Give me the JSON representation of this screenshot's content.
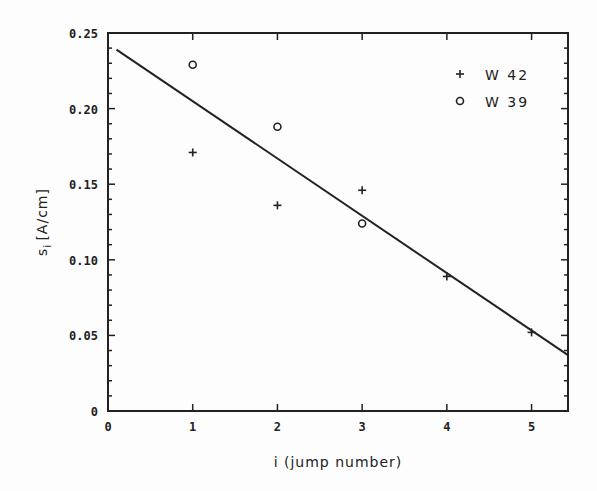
{
  "chart_data": {
    "type": "scatter",
    "title": "",
    "xlabel": "i (jump number)",
    "ylabel": "s",
    "ylabel_subscript": "i",
    "ylabel_units": "[A/cm]",
    "xlim": [
      0,
      5.43
    ],
    "ylim": [
      0,
      0.25
    ],
    "x_ticks": [
      0,
      1,
      2,
      3,
      4,
      5
    ],
    "x_tick_labels": [
      "0",
      "1",
      "2",
      "3",
      "4",
      "5"
    ],
    "y_ticks": [
      0,
      0.05,
      0.1,
      0.15,
      0.2,
      0.25
    ],
    "y_tick_labels": [
      "0",
      "0.05",
      "0.10",
      "0.15",
      "0.20",
      "0.25"
    ],
    "y_minor_step": 0.01,
    "grid": false,
    "legend_position": "upper right",
    "series": [
      {
        "name": "W 42",
        "marker": "+",
        "x": [
          1,
          2,
          3,
          4,
          5
        ],
        "y": [
          0.171,
          0.136,
          0.146,
          0.089,
          0.052
        ]
      },
      {
        "name": "W 39",
        "marker": "o",
        "x": [
          1,
          2,
          3
        ],
        "y": [
          0.229,
          0.188,
          0.124
        ]
      }
    ],
    "fit_line": {
      "name": "linear fit",
      "x": [
        0.1,
        5.43
      ],
      "y": [
        0.239,
        0.037
      ]
    }
  },
  "colors": {
    "ink": "#222222",
    "background": "#fdfdfd"
  }
}
